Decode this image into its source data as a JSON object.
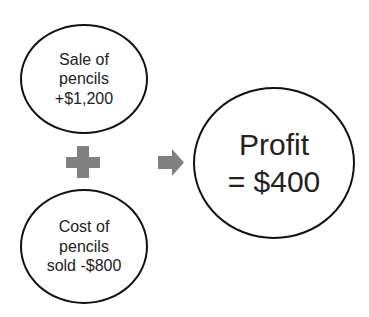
{
  "diagram": {
    "nodes": [
      {
        "id": "sale",
        "text": "Sale of\npencils\n+$1,200"
      },
      {
        "id": "cost",
        "text": "Cost of\npencils\nsold  -$800"
      },
      {
        "id": "profit",
        "text": "Profit\n= $400"
      }
    ],
    "operators": {
      "plus": "plus-sign",
      "arrow": "right-arrow"
    },
    "colors": {
      "operator": "#808080",
      "outline": "#111111"
    }
  }
}
